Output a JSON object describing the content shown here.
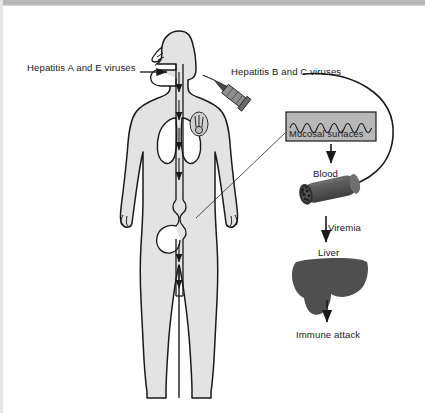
{
  "diagram": {
    "type": "medical-illustration",
    "colors": {
      "body_fill": "#e3e3e3",
      "outline": "#1a1a1a",
      "organ_dark": "#4f4f4f",
      "box_fill": "#b8b8b8",
      "scan_band": "#b4b4b4",
      "background": "#ffffff",
      "text": "#1a1a1a"
    },
    "labels": {
      "hepatitis_a_e": "Hepatitis A and E viruses",
      "hepatitis_b_c": "Hepatitis B and C viruses",
      "mucosal_surfaces": "Mucosal surfaces",
      "blood": "Blood",
      "viremia": "Viremia",
      "liver": "Liver",
      "immune_attack": "Immune attack"
    },
    "figures": {
      "human_body": "human-body-silhouette",
      "syringe": "syringe-needle-icon",
      "injection_site": "injection-site-icon",
      "mucosa_wave": "mucosal-wave-pattern",
      "blood_vessel": "blood-vessel-illustration",
      "liver_organ": "liver-silhouette",
      "lungs": "lungs-outline",
      "digestive_tract": "digestive-tract-outline"
    },
    "pathways": [
      {
        "id": "enteric-route",
        "label": "Hepatitis A and E viruses",
        "entry": "mouth / ingestion",
        "arrow": "horizontal-arrow-to-mouth"
      },
      {
        "id": "parenteral-route",
        "label": "Hepatitis B and C viruses",
        "entry": "skin / needle injection",
        "arrow": "curved-arrow-to-blood"
      },
      {
        "id": "mucosa-to-blood",
        "from": "Mucosal surfaces",
        "to": "Blood",
        "arrow": "down-arrow"
      },
      {
        "id": "blood-to-liver",
        "from": "Blood",
        "to": "Liver",
        "label": "Viremia",
        "arrow": "down-arrow"
      },
      {
        "id": "liver-to-immune",
        "from": "Liver",
        "to": "Immune attack",
        "arrow": "down-arrow"
      },
      {
        "id": "gut-to-mucosa",
        "from": "digestive tract",
        "to": "Mucosal surfaces",
        "arrow": "leader-line"
      }
    ]
  }
}
